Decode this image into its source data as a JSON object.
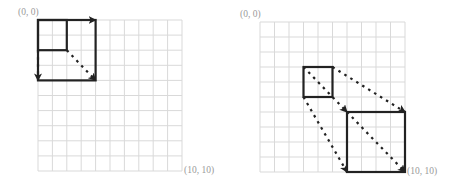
{
  "colors": {
    "grid": "#d9d9d9",
    "shape": "#222222",
    "label": "#9a9a9a",
    "background": "#ffffff"
  },
  "panels": [
    {
      "name": "scale-down-panel",
      "origin_px": [
        38,
        20
      ],
      "cell_px": [
        14.4,
        15.1
      ],
      "grid_cells": 10,
      "labels": {
        "top_left": "(0, 0)",
        "bottom_right": "(10, 10)"
      },
      "squares": [
        {
          "name": "small-square",
          "from": [
            0,
            0
          ],
          "to": [
            2,
            2
          ]
        },
        {
          "name": "large-square",
          "from": [
            0,
            0
          ],
          "to": [
            4,
            4
          ]
        }
      ],
      "arrows": [
        {
          "name": "arrow-top-edge",
          "from": [
            2,
            0
          ],
          "to": [
            4,
            0
          ],
          "style": "dotted"
        },
        {
          "name": "arrow-left-edge",
          "from": [
            0,
            2
          ],
          "to": [
            0,
            4
          ],
          "style": "dotted"
        },
        {
          "name": "arrow-diagonal",
          "from": [
            2,
            2
          ],
          "to": [
            4,
            4
          ],
          "style": "dotted"
        }
      ]
    },
    {
      "name": "translate-scale-panel",
      "origin_px": [
        260,
        22
      ],
      "cell_px": [
        14.5,
        15.0
      ],
      "grid_cells": 10,
      "labels": {
        "top_left": "(0, 0)",
        "bottom_right": "(10, 10)"
      },
      "squares": [
        {
          "name": "small-square",
          "from": [
            3,
            3
          ],
          "to": [
            5,
            5
          ]
        },
        {
          "name": "large-square",
          "from": [
            6,
            6
          ],
          "to": [
            10,
            10
          ]
        }
      ],
      "arrows": [
        {
          "name": "arrow-top-left-to-top-left",
          "from": [
            3,
            3
          ],
          "to": [
            6,
            6
          ],
          "style": "dotted"
        },
        {
          "name": "arrow-top-right-to-top-right",
          "from": [
            5,
            3
          ],
          "to": [
            10,
            6
          ],
          "style": "dotted"
        },
        {
          "name": "arrow-bottom-left-to-bottom-left",
          "from": [
            3,
            5
          ],
          "to": [
            6,
            10
          ],
          "style": "dotted"
        },
        {
          "name": "arrow-diagonal-to-bottom-right",
          "from": [
            6,
            6
          ],
          "to": [
            10,
            10
          ],
          "style": "dotted"
        }
      ]
    }
  ]
}
